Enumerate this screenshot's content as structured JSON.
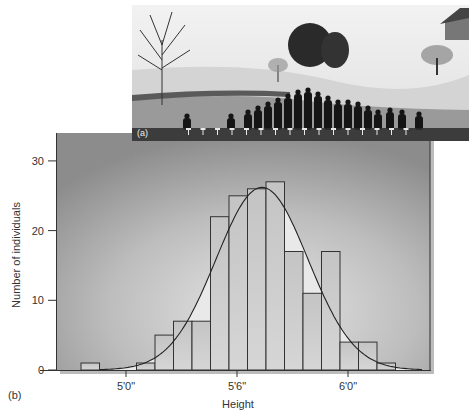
{
  "figure": {
    "panel_a_label": "(a)",
    "panel_b_label": "(b)",
    "photo_description": "Historical photograph of a group of people arranged in rows by height on a snowy lawn with trees and a house in the background"
  },
  "chart_data": {
    "type": "bar",
    "title": "",
    "xlabel": "Height",
    "ylabel": "Number of individuals",
    "ylim": [
      0,
      30
    ],
    "yticks": [
      0,
      10,
      20,
      30
    ],
    "xticks": [
      "5'0\"",
      "5'6\"",
      "6'0\""
    ],
    "grid": false,
    "legend": null,
    "categories": [
      "4'10\"",
      "4'11\"",
      "5'0\"",
      "5'1\"",
      "5'2\"",
      "5'3\"",
      "5'4\"",
      "5'5\"",
      "5'6\"",
      "5'7\"",
      "5'8\"",
      "5'9\"",
      "5'10\"",
      "5'11\"",
      "6'0\"",
      "6'1\"",
      "6'2\""
    ],
    "values": [
      1,
      0,
      0,
      1,
      5,
      7,
      7,
      22,
      25,
      26,
      27,
      17,
      11,
      17,
      4,
      4,
      1
    ],
    "overlay": {
      "type": "normal-curve",
      "description": "Bell-shaped normal distribution curve fitted over histogram, peaking near 26 at about 5'7\""
    }
  }
}
